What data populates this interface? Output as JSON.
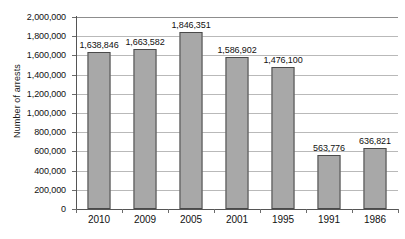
{
  "chart_data": {
    "type": "bar",
    "title": "",
    "xlabel": "",
    "ylabel": "Number of arrests",
    "categories": [
      "2010",
      "2009",
      "2005",
      "2001",
      "1995",
      "1991",
      "1986"
    ],
    "values": [
      1638846,
      1663582,
      1846351,
      1586902,
      1476100,
      563776,
      636821
    ],
    "value_labels": [
      "1,638,846",
      "1,663,582",
      "1,846,351",
      "1,586,902",
      "1,476,100",
      "563,776",
      "636,821"
    ],
    "ylim": [
      0,
      2000000
    ],
    "ytick_values": [
      0,
      200000,
      400000,
      600000,
      800000,
      1000000,
      1200000,
      1400000,
      1600000,
      1800000,
      2000000
    ],
    "ytick_labels": [
      "0",
      "200,000",
      "400,000",
      "600,000",
      "800,000",
      "1,000,000",
      "1,200,000",
      "1,400,000",
      "1,600,000",
      "1,800,000",
      "2,000,000"
    ],
    "grid": true,
    "grid_axis": "y",
    "legend": false,
    "legend_position": "none",
    "bar_color": "#a8a8a8",
    "bar_border_color": "#4a4a4a",
    "gridline_color": "#b9b9b9",
    "axis_color": "#555555",
    "text_color": "#111111",
    "background": "#ffffff"
  }
}
